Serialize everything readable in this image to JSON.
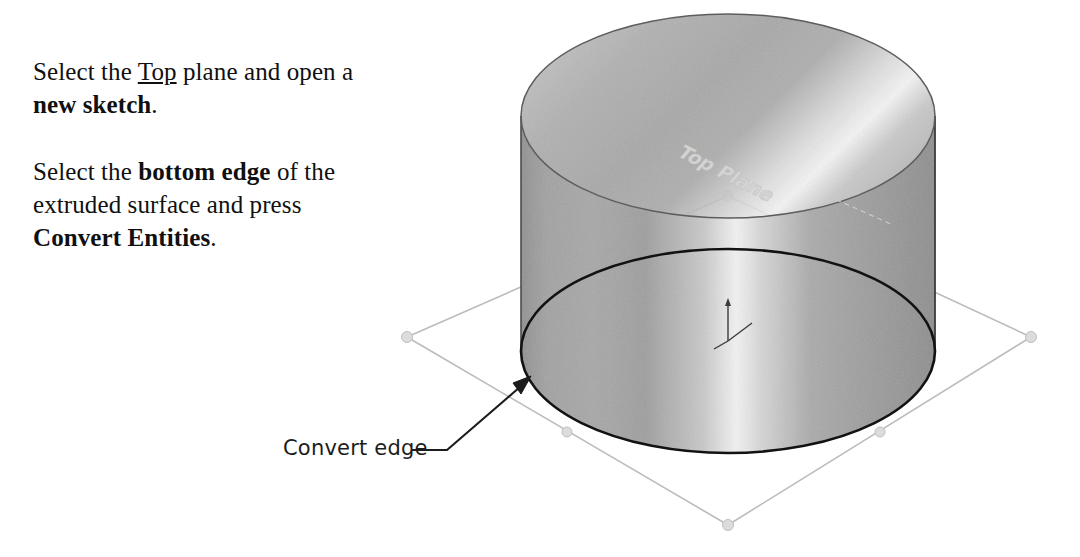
{
  "instructions": {
    "paragraph1": {
      "part1": "Select the ",
      "underlined": "Top",
      "part2": " plane and open a ",
      "bold": "new sketch",
      "part3": "."
    },
    "paragraph2": {
      "part1": "Select the ",
      "bold1": "bottom edge",
      "part2": " of the extruded surface and press ",
      "bold2": "Convert Entities",
      "part3": "."
    }
  },
  "illustration": {
    "plane_label": "Top Plane",
    "callout_label": "Convert edge",
    "colors": {
      "surface_dark": "#9a9a9a",
      "surface_mid": "#b4b4b4",
      "surface_light": "#ededed",
      "outline_dark": "#1a1a1a",
      "outline_soft": "#6f6f6f",
      "plane_line": "#b9b9b9",
      "plane_handle": "#d8d8d8",
      "leader": "#1c1c1c",
      "plane_label_text": "#cfcfcf",
      "background": "#ffffff"
    },
    "geometry": {
      "cylinder_center_x": 728,
      "cylinder_radius_x": 207,
      "top_ellipse_center_y": 116,
      "bottom_ellipse_center_y": 351,
      "ellipse_radius_y": 102,
      "plane_corners": "407,337 728,196 1031,337 728,525",
      "origin_marker_x": 728,
      "origin_marker_y": 330,
      "arrow_tip_x": 527,
      "arrow_tip_y": 378
    }
  }
}
